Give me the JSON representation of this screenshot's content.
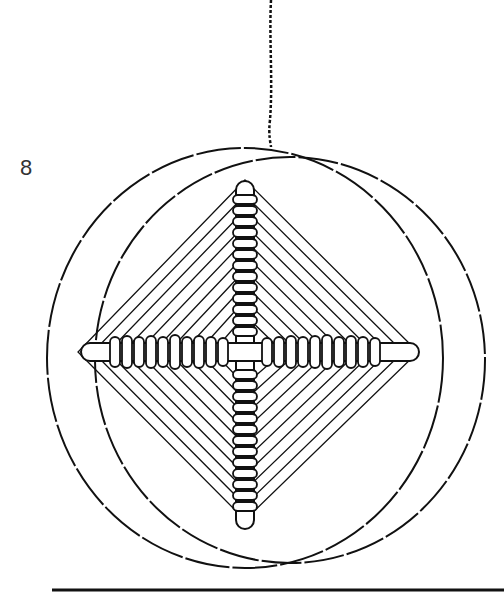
{
  "figure": {
    "label": "8",
    "colors": {
      "ink": "#111111",
      "background": "#ffffff"
    }
  }
}
